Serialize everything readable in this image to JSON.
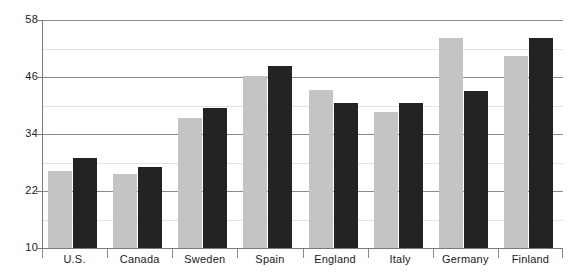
{
  "chart_data": {
    "type": "bar",
    "title": "",
    "subtitle": "",
    "xlabel": "",
    "ylabel": "",
    "categories": [
      "U.S.",
      "Canada",
      "Sweden",
      "Spain",
      "England",
      "Italy",
      "Germany",
      "Finland"
    ],
    "series": [
      {
        "name": "Series 1",
        "color": "#c4c4c4",
        "values": [
          26.2,
          25.6,
          37.4,
          46.2,
          43.3,
          38.6,
          54.2,
          50.4
        ]
      },
      {
        "name": "Series 2",
        "color": "#232323",
        "values": [
          28.9,
          27.1,
          39.5,
          48.3,
          40.5,
          40.5,
          43.1,
          54.2
        ]
      }
    ],
    "ylim": [
      10,
      58
    ],
    "y_ticks": [
      10,
      22,
      34,
      46,
      58
    ],
    "y_tick_labels": [
      "10",
      "22",
      "34",
      "46",
      "58"
    ],
    "y_minor_ticks": [
      16,
      28,
      40,
      52
    ],
    "grid": true,
    "grid_axis": "y",
    "legend": "none",
    "legend_position": "none",
    "annotations": []
  },
  "axis": {
    "major_gridline_color": "#8a8a8a",
    "minor_gridline_color": "#e2e2e2",
    "axis_line_color": "#7a7a7a"
  }
}
